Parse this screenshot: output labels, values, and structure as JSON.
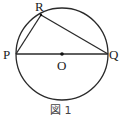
{
  "figure": {
    "caption": "図 1",
    "circle": {
      "cx": 62,
      "cy": 54,
      "r": 46,
      "stroke": "#2a2a2a"
    },
    "center_label": "O",
    "points": [
      {
        "id": "P",
        "label": "P",
        "x": 16,
        "y": 54
      },
      {
        "id": "Q",
        "label": "Q",
        "x": 108,
        "y": 54
      },
      {
        "id": "R",
        "label": "R",
        "x": 41,
        "y": 15
      }
    ],
    "segments": [
      "PQ",
      "PR",
      "RQ"
    ]
  }
}
